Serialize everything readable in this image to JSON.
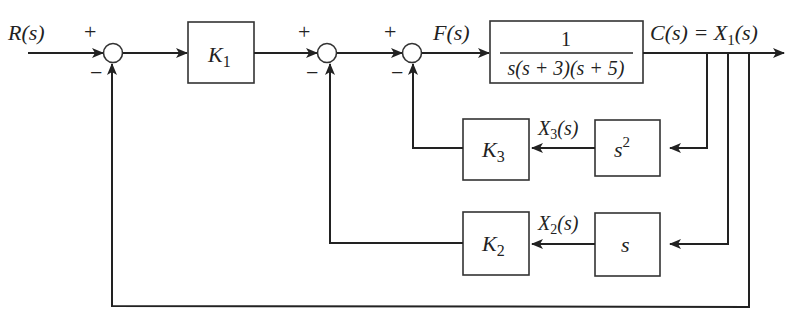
{
  "diagram": {
    "type": "control-system-block-diagram",
    "input": {
      "label": "R(s)"
    },
    "output": {
      "label": "C(s) = X",
      "sub": "1",
      "tail": "(s)"
    },
    "summing_junctions": [
      {
        "id": "sum1",
        "plus": "+",
        "minus": "−"
      },
      {
        "id": "sum2",
        "plus": "+",
        "minus": "−"
      },
      {
        "id": "sum3",
        "plus": "+",
        "minus": "−"
      }
    ],
    "signals": {
      "f": "F(s)",
      "x3": {
        "base": "X",
        "sub": "3",
        "tail": "(s)"
      },
      "x2": {
        "base": "X",
        "sub": "2",
        "tail": "(s)"
      }
    },
    "blocks": {
      "k1": {
        "base": "K",
        "sub": "1"
      },
      "plant": {
        "numerator": "1",
        "denominator": "s(s + 3)(s + 5)"
      },
      "k3": {
        "base": "K",
        "sub": "3"
      },
      "s2": {
        "base": "s",
        "sup": "2"
      },
      "k2": {
        "base": "K",
        "sub": "2"
      },
      "s": {
        "base": "s"
      }
    }
  }
}
